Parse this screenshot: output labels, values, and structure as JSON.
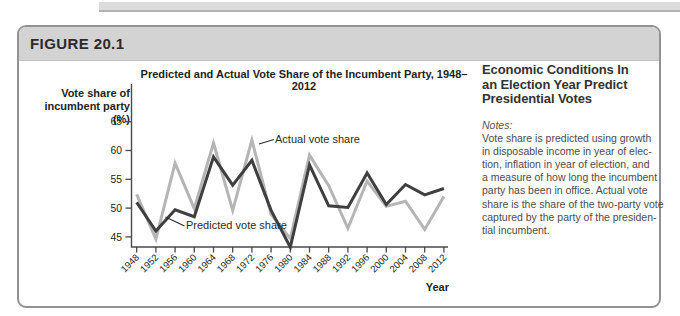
{
  "page": {
    "figure_label": "FIGURE 20.1"
  },
  "chart_data": {
    "type": "line",
    "title": "Predicted and Actual Vote Share of the Incumbent Party, 1948–2012",
    "ylabel_lines": [
      "Vote share of",
      "incumbent party (%)"
    ],
    "xlabel": "Year",
    "x": [
      1948,
      1952,
      1956,
      1960,
      1964,
      1968,
      1972,
      1976,
      1980,
      1984,
      1988,
      1992,
      1996,
      2000,
      2004,
      2008,
      2012
    ],
    "series": [
      {
        "name": "Actual vote share",
        "color": "#b5b5b5",
        "values": [
          52.4,
          44.6,
          57.8,
          49.9,
          61.3,
          49.6,
          61.8,
          48.9,
          44.7,
          59.2,
          53.9,
          46.5,
          54.7,
          50.3,
          51.2,
          46.3,
          52.0
        ]
      },
      {
        "name": "Predicted vote share",
        "color": "#3f3f3f",
        "values": [
          51.0,
          46.0,
          49.7,
          48.5,
          58.9,
          54.0,
          58.3,
          49.6,
          43.2,
          57.5,
          50.4,
          50.1,
          56.1,
          50.6,
          54.1,
          52.3,
          53.4
        ]
      }
    ],
    "yticks": [
      45,
      50,
      55,
      60,
      65
    ],
    "ylim": [
      43.3,
      66.5
    ],
    "grid": false,
    "legend_position": "inline-annotations",
    "annotations": [
      {
        "text": "Actual vote share"
      },
      {
        "text": "Predicted vote share"
      }
    ],
    "axis_color": "#4a4a4a",
    "text_color": "#231f20"
  },
  "sidebar": {
    "heading_lines": [
      "Economic Conditions In",
      "an Election Year Predict",
      "Presidential Votes"
    ],
    "notes_label": "Notes:",
    "notes_lines": [
      "Vote share is predicted using growth",
      "in disposable income in year of elec-",
      "tion, inflation in year of election, and",
      "a measure of how long the incumbent",
      "party has been in office. Actual vote",
      "share is the share of the two-party vote",
      "captured by the party of the presiden-",
      "tial incumbent."
    ]
  }
}
